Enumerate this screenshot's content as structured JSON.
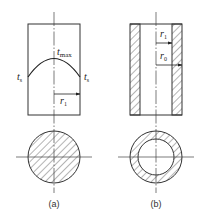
{
  "figure": {
    "panel_a": {
      "caption": "(a)",
      "labels": {
        "t_max": {
          "base": "t",
          "sub": "max"
        },
        "t_s_left": {
          "base": "t",
          "sub": "s"
        },
        "t_s_right": {
          "base": "t",
          "sub": "s"
        },
        "r_1": {
          "base": "r",
          "sub": "1"
        }
      },
      "description": "Solid cylinder with parabolic temperature profile, cross-section fully hatched"
    },
    "panel_b": {
      "caption": "(b)",
      "labels": {
        "r_1": {
          "base": "r",
          "sub": "1"
        },
        "r_0": {
          "base": "r",
          "sub": "0"
        }
      },
      "description": "Hollow cylinder with hatched wall, annular cross-section"
    },
    "colors": {
      "line": "#333333",
      "background": "#ffffff"
    }
  }
}
